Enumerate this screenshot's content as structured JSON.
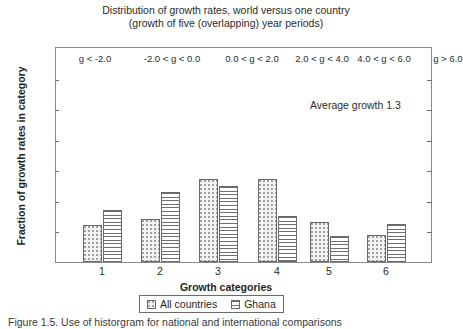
{
  "figure": {
    "title_line1": "Distribution of growth rates, world versus one country",
    "title_line2": "(growth of five (overlapping) year periods)",
    "annotation": "Average growth 1.3",
    "caption": "Figure 1.5. Use of historgram for national and international comparisons"
  },
  "legend": {
    "series1_label": "All countries",
    "series2_label": "Ghana",
    "position": "below-axis-center"
  },
  "chart_data": {
    "type": "bar",
    "title": "Distribution of growth rates, world versus one country (growth of five (overlapping) year periods)",
    "xlabel": "Growth categories",
    "ylabel": "Fraction of growth rates in category",
    "categories": [
      "1",
      "2",
      "3",
      "4",
      "5",
      "6"
    ],
    "category_ranges": [
      "g < -2.0",
      "-2.0 < g < 0.0",
      "0.0 < g < 2.0",
      "2.0 < g < 4.0",
      "4.0 < g < 6.0",
      "g > 6.0"
    ],
    "series": [
      {
        "name": "All countries",
        "values": [
          0.12,
          0.14,
          0.27,
          0.27,
          0.13,
          0.09
        ]
      },
      {
        "name": "Ghana",
        "values": [
          0.17,
          0.23,
          0.25,
          0.15,
          0.085,
          0.125
        ]
      }
    ],
    "ylim": [
      0.0,
      0.7
    ],
    "yticks": [
      "0.0",
      "0.1",
      "0.2",
      "0.3",
      "0.4",
      "0.5",
      "0.6",
      "0.7"
    ],
    "ytick_values": [
      0.0,
      0.1,
      0.2,
      0.3,
      0.4,
      0.5,
      0.6,
      0.7
    ],
    "grid": false,
    "legend_position": "bottom-center",
    "annotations": [
      "Average growth 1.3"
    ]
  },
  "colors": {
    "frame": "#8a8a8a",
    "bar_outline": "#6a6a6a",
    "series1_fill": "#f2f2f2",
    "series2_fill": "#ffffff",
    "text": "#2b2b2b",
    "background": "#ffffff"
  }
}
